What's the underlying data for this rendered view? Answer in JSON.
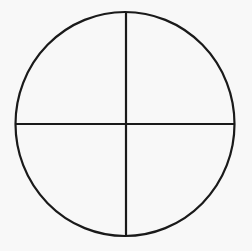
{
  "diagram": {
    "type": "circle-divided-into-quadrants",
    "background": "#f8f8f8",
    "stroke_color": "#1a1a1a",
    "stroke_width": 2.2,
    "circle": {
      "cx": 125,
      "cy": 124,
      "rx": 109.5,
      "ry": 112
    },
    "vertical_divider": {
      "x": 126,
      "y1": 12,
      "y2": 236
    },
    "horizontal_divider": {
      "y": 124,
      "x1": 16,
      "x2": 234
    },
    "quadrants": 4
  }
}
